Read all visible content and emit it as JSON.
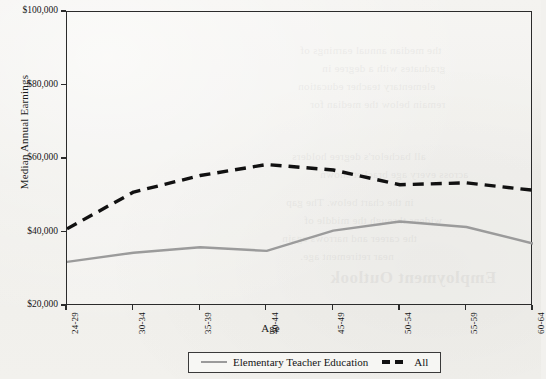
{
  "chart_data": {
    "type": "line",
    "title": "",
    "xlabel": "Age",
    "ylabel": "Median Annual Earnings",
    "categories": [
      "24-29",
      "30-34",
      "35-39",
      "40-44",
      "45-49",
      "50-54",
      "55-59",
      "60-64"
    ],
    "ylim": [
      20000,
      100000
    ],
    "ytick_labels": [
      "$20,000",
      "$40,000",
      "$60,000",
      "$80,000",
      "$100,000"
    ],
    "ytick_values": [
      20000,
      40000,
      60000,
      80000,
      100000
    ],
    "grid": false,
    "legend_position": "bottom",
    "series": [
      {
        "name": "Elementary Teacher Education",
        "style": "solid",
        "color": "#9b9b9b",
        "values": [
          32000,
          34500,
          36000,
          35000,
          40500,
          43000,
          41500,
          37000
        ]
      },
      {
        "name": "All",
        "style": "dashed",
        "color": "#111111",
        "values": [
          41000,
          51000,
          55500,
          58500,
          57000,
          53000,
          53500,
          51500
        ]
      }
    ]
  },
  "axes": {
    "y_title": "Median Annual Earnings",
    "x_title": "Age"
  },
  "legend": {
    "items": [
      {
        "label": "Elementary Teacher Education",
        "swatch": "solid-line-swatch"
      },
      {
        "label": "All",
        "swatch": "dashed-line-swatch"
      }
    ]
  },
  "background_bleed": {
    "heading": "Employment Outlook",
    "lines": [
      "the median annual earnings of",
      "graduates with a degree in",
      "elementary teacher education",
      "remain below the median for",
      "all bachelor's degree holders",
      "across every age bracket shown",
      "in the chart below. The gap",
      "widens through the middle of",
      "the career and narrows again",
      "near retirement age."
    ]
  }
}
